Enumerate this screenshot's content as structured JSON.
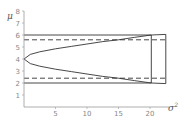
{
  "chart_data": {
    "type": "line",
    "title": "",
    "xlabel": "σ²",
    "ylabel": "μ",
    "xlim": [
      0,
      23
    ],
    "ylim": [
      0,
      8
    ],
    "grid": false,
    "x_ticks": [
      5,
      10,
      15,
      20
    ],
    "y_ticks": [
      1,
      2,
      3,
      4,
      5,
      6,
      7,
      8
    ],
    "series": [
      {
        "name": "upper curve",
        "style": "solid",
        "x": [
          0,
          1,
          2.5,
          5,
          7.5,
          10,
          12.5,
          15,
          17.5,
          20.2
        ],
        "y": [
          4.0,
          4.38,
          4.6,
          4.85,
          5.05,
          5.25,
          5.45,
          5.6,
          5.8,
          6.0
        ]
      },
      {
        "name": "lower curve",
        "style": "solid",
        "x": [
          0,
          1,
          2.5,
          5,
          7.5,
          10,
          12.5,
          15,
          17.5,
          20.2
        ],
        "y": [
          4.0,
          3.62,
          3.4,
          3.15,
          2.95,
          2.75,
          2.55,
          2.4,
          2.2,
          2.0
        ]
      },
      {
        "name": "upper bound",
        "style": "solid",
        "x": [
          0,
          20.2
        ],
        "y": [
          6.0,
          6.0
        ]
      },
      {
        "name": "lower bound",
        "style": "solid",
        "x": [
          0,
          20.2
        ],
        "y": [
          2.0,
          2.0
        ]
      },
      {
        "name": "upper dashed",
        "style": "dashed",
        "x": [
          0,
          22.5
        ],
        "y": [
          5.6,
          5.6
        ]
      },
      {
        "name": "lower dashed",
        "style": "dashed",
        "x": [
          0,
          22.5
        ],
        "y": [
          2.4,
          2.4
        ]
      },
      {
        "name": "vertical at 20.2",
        "style": "solid",
        "x": [
          20.2,
          20.2
        ],
        "y": [
          2.0,
          6.0
        ]
      },
      {
        "name": "outer box",
        "style": "solid",
        "x": [
          20.2,
          22.5,
          22.5,
          20.2
        ],
        "y": [
          6.0,
          6.05,
          1.95,
          2.0
        ]
      }
    ],
    "annotations": []
  },
  "axes": {
    "x_label": "σ",
    "x_label_sup": "2",
    "y_label": "μ",
    "x_tick_labels": [
      "5",
      "10",
      "15",
      "20"
    ],
    "y_tick_labels": [
      "1",
      "2",
      "3",
      "4",
      "5",
      "6",
      "7",
      "8"
    ]
  }
}
